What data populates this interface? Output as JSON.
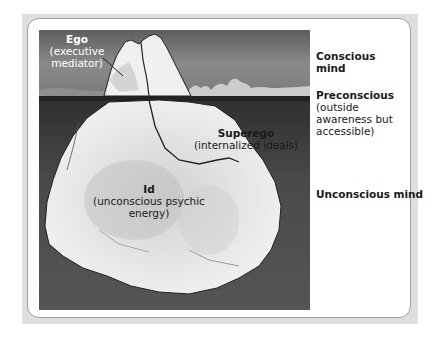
{
  "figure": {
    "illustration": "iceberg-model-of-mind",
    "colors": {
      "frame_bg": "#dedede",
      "panel_bg": "#ffffff",
      "panel_border": "#9e9e9e",
      "sky": "#6f6f6f",
      "water": "#4a4a4a",
      "ice": "#e8e8e8"
    },
    "iceberg_labels": {
      "ego": {
        "title": "Ego",
        "subtitle": "(executive mediator)"
      },
      "superego": {
        "title": "Superego",
        "subtitle": "(internalized ideals)"
      },
      "id": {
        "title": "Id",
        "subtitle": "(unconscious psychic energy)"
      }
    },
    "side_labels": {
      "conscious": {
        "title": "Conscious mind"
      },
      "preconscious": {
        "title": "Preconscious",
        "subtitle": "(outside awareness but accessible)"
      },
      "unconscious": {
        "title": "Unconscious mind"
      }
    }
  }
}
